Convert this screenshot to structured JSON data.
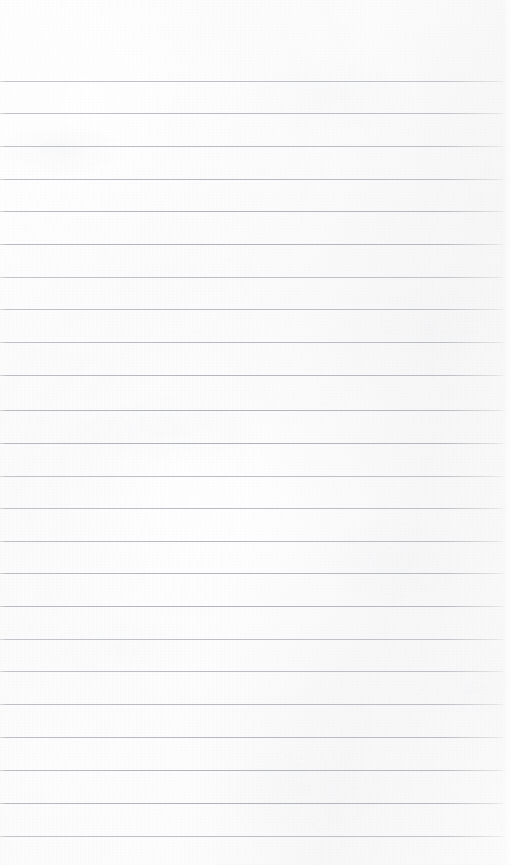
{
  "document": {
    "type": "lined-notepad-page",
    "title": "Blank ruled notepad page",
    "content_text": "",
    "page_width": 511,
    "page_height": 865,
    "paper_color": "#fbfbfb",
    "rule_color": "#b0b4ba",
    "rule_count": 24,
    "first_rule_y": 81,
    "rule_spacing": 32.7,
    "rule_left_x": 0,
    "rule_right_x": 506,
    "top_margin_height": 81,
    "bottom_margin_height": 29,
    "has_vertical_margin_line": false,
    "rule_positions_y": [
      81,
      113,
      146,
      179,
      211,
      244,
      277,
      309,
      342,
      375,
      410,
      443,
      476,
      508,
      541,
      573,
      606,
      639,
      671,
      704,
      737,
      770,
      803,
      836
    ]
  }
}
